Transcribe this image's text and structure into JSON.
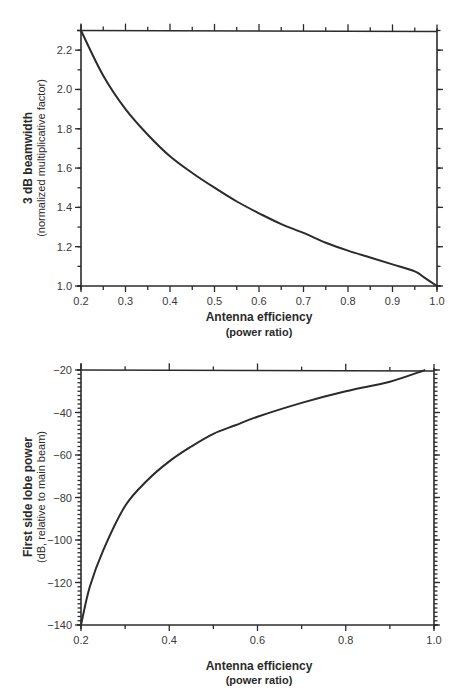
{
  "chart_data": [
    {
      "type": "line",
      "title": "",
      "xlabel": "Antenna efficiency",
      "xlabel_sub": "(power ratio)",
      "ylabel": "3 dB beamwidth",
      "ylabel_sub": "(normalized multiplicative factor)",
      "xlim": [
        0.2,
        1.0
      ],
      "ylim": [
        1.0,
        2.3
      ],
      "x_ticks": [
        "0.2",
        "0.3",
        "0.4",
        "0.5",
        "0.6",
        "0.7",
        "0.8",
        "0.9",
        "1.0"
      ],
      "y_ticks": [
        "1.0",
        "1.2",
        "1.4",
        "1.6",
        "1.8",
        "2.0",
        "2.2"
      ],
      "grid": false,
      "legend": null,
      "series": [
        {
          "name": "beamwidth",
          "x": [
            0.2,
            0.25,
            0.3,
            0.35,
            0.4,
            0.45,
            0.5,
            0.55,
            0.6,
            0.65,
            0.7,
            0.75,
            0.8,
            0.85,
            0.9,
            0.95,
            0.97,
            1.0
          ],
          "values": [
            2.3,
            2.07,
            1.9,
            1.77,
            1.66,
            1.575,
            1.5,
            1.43,
            1.37,
            1.315,
            1.27,
            1.22,
            1.18,
            1.145,
            1.11,
            1.075,
            1.045,
            1.0
          ]
        }
      ]
    },
    {
      "type": "line",
      "title": "",
      "xlabel": "Antenna efficiency",
      "xlabel_sub": "(power ratio)",
      "ylabel": "First side lobe power",
      "ylabel_sub": "(dB, relative to main beam)",
      "xlim": [
        0.2,
        1.0
      ],
      "ylim": [
        -140,
        -20
      ],
      "x_ticks": [
        "0.2",
        "0.4",
        "0.6",
        "0.8",
        "1.0"
      ],
      "y_ticks": [
        "-20",
        "-40",
        "-60",
        "-80",
        "-100",
        "-120",
        "-140"
      ],
      "grid": false,
      "legend": null,
      "series": [
        {
          "name": "side lobe power",
          "x": [
            0.2,
            0.22,
            0.25,
            0.3,
            0.35,
            0.4,
            0.45,
            0.5,
            0.55,
            0.6,
            0.7,
            0.8,
            0.9,
            0.98
          ],
          "values": [
            -140,
            -122,
            -105,
            -84,
            -72,
            -63,
            -56,
            -50,
            -46,
            -42,
            -35.5,
            -30,
            -25.5,
            -20
          ]
        }
      ]
    }
  ],
  "labels": {
    "top": {
      "xlabel": "Antenna efficiency",
      "xlabel_sub": "(power ratio)",
      "ylabel": "3 dB beamwidth",
      "ylabel_sub": "(normalized multiplicative factor)"
    },
    "bottom": {
      "xlabel": "Antenna efficiency",
      "xlabel_sub": "(power ratio)",
      "ylabel": "First side lobe power",
      "ylabel_sub": "(dB, relative to main beam)"
    }
  }
}
